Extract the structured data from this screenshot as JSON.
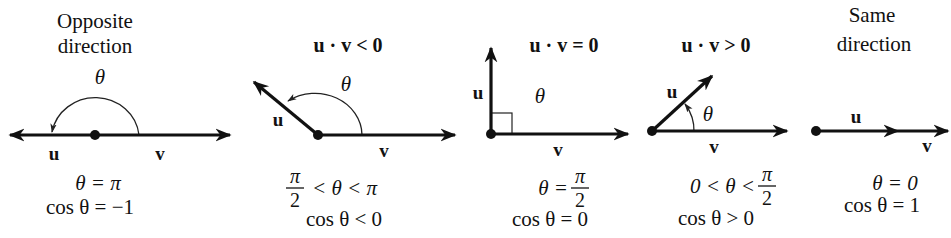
{
  "panels": [
    {
      "id": "opposite",
      "heading": [
        "Opposite",
        "direction"
      ],
      "dot_label": "",
      "theta_symbol": "θ",
      "u_label": "u",
      "v_label": "v",
      "line1": "θ = π",
      "line2": "cos θ = −1"
    },
    {
      "id": "obtuse",
      "heading": "u · v < 0",
      "theta_symbol": "θ",
      "u_label": "u",
      "v_label": "v",
      "line1_frac_num": "π",
      "line1_frac_den": "2",
      "line1_rest": "< θ < π",
      "line2": "cos θ < 0"
    },
    {
      "id": "orthogonal",
      "heading": "u · v = 0",
      "theta_symbol": "θ",
      "u_label": "u",
      "v_label": "v",
      "line1_lhs": "θ =",
      "line1_frac_num": "π",
      "line1_frac_den": "2",
      "line2": "cos θ = 0"
    },
    {
      "id": "acute",
      "heading": "u · v > 0",
      "theta_symbol": "θ",
      "u_label": "u",
      "v_label": "v",
      "line1_lhs": "0 < θ <",
      "line1_frac_num": "π",
      "line1_frac_den": "2",
      "line2": "cos θ > 0"
    },
    {
      "id": "same",
      "heading": [
        "Same",
        "direction"
      ],
      "u_label": "u",
      "v_label": "v",
      "line1": "θ = 0",
      "line2": "cos θ = 1"
    }
  ],
  "colors": {
    "ink": "#111111",
    "background": "#ffffff"
  }
}
